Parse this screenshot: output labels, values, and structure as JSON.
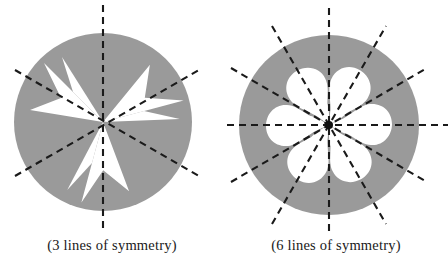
{
  "page": {
    "background_color": "#ffffff",
    "width": 448,
    "height": 265
  },
  "style": {
    "disk_fill": "#9a9a9a",
    "cutout_fill": "#ffffff",
    "symmetry_line_color": "#1a1a1a",
    "text_color": "#1a1a1a"
  },
  "figures": [
    {
      "id": "figure-three-lines",
      "caption": "(3 lines of symmetry)",
      "lines_of_symmetry": 3,
      "shape": "pinwheel-darts-in-disk",
      "cutout_count": 6,
      "disk": {
        "cx": 103,
        "cy": 122,
        "r": 89
      },
      "symmetry_line_angles_deg": [
        90,
        30,
        150
      ],
      "symmetry_lines": [
        {
          "name": "vertical-axis",
          "angle_deg": 90
        },
        {
          "name": "upper-right-diagonal-axis",
          "angle_deg": 30
        },
        {
          "name": "upper-left-diagonal-axis",
          "angle_deg": 150
        }
      ]
    },
    {
      "id": "figure-six-lines",
      "caption": "(6 lines of symmetry)",
      "lines_of_symmetry": 6,
      "shape": "six-petal-teardrops-in-disk",
      "cutout_count": 12,
      "disk": {
        "cx": 105,
        "cy": 125,
        "r": 90
      },
      "symmetry_line_angles_deg": [
        0,
        30,
        60,
        90,
        120,
        150
      ],
      "symmetry_lines": [
        {
          "name": "horizontal-axis",
          "angle_deg": 0
        },
        {
          "name": "axis-30",
          "angle_deg": 30
        },
        {
          "name": "axis-60",
          "angle_deg": 60
        },
        {
          "name": "vertical-axis",
          "angle_deg": 90
        },
        {
          "name": "axis-120",
          "angle_deg": 120
        },
        {
          "name": "axis-150",
          "angle_deg": 150
        }
      ]
    }
  ]
}
